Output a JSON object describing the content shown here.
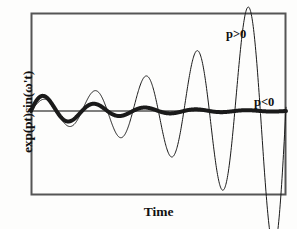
{
  "figure": {
    "background_color": "#fdfdfc",
    "frame_color": "#555555",
    "curve_color": "#1a1a1a"
  },
  "chart_data": {
    "type": "line",
    "title": "",
    "xlabel": "Time",
    "ylabel": "exp(pt)sin(ω't)",
    "grid": false,
    "legend": "inline-annotations",
    "axis_ticks": false,
    "xlim": [
      0,
      8
    ],
    "ylim": [
      -2.6,
      2.6
    ],
    "baseline": 0,
    "annotations": [
      {
        "text": "p>0",
        "x": 6.1,
        "y": 2.3
      },
      {
        "text": "p<0",
        "x": 7.0,
        "y": 0.45
      }
    ],
    "series": [
      {
        "name": "p>0",
        "label": "p>0",
        "description": "Exponentially growing damped sinusoid, thin stroke",
        "line_width": 1,
        "formula": "exp(pt)sin(ω't) with p > 0",
        "growth_rate": 0.34,
        "angular_frequency": 3.93,
        "initial_amplitude": 0.33,
        "x": [
          0,
          0.4,
          0.8,
          1.2,
          1.6,
          2.0,
          2.4,
          2.8,
          3.2,
          3.6,
          4.0,
          4.4,
          4.8,
          5.2,
          5.6,
          6.0,
          6.4,
          6.8,
          7.2,
          7.6,
          8.0
        ],
        "values": [
          0,
          0.37,
          0.09,
          -0.35,
          -0.34,
          0.26,
          0.58,
          0.05,
          -0.69,
          -0.56,
          0.48,
          1.07,
          0.1,
          -1.35,
          -1.08,
          0.92,
          2.03,
          0.18,
          -2.58,
          -2.06,
          1.76
        ]
      },
      {
        "name": "p<0",
        "label": "p<0",
        "description": "Exponentially decaying sinusoid, thick stroke",
        "line_width": 4,
        "formula": "exp(pt)sin(ω't) with p < 0",
        "growth_rate": -0.46,
        "angular_frequency": 3.93,
        "initial_amplitude": 0.58,
        "x": [
          0,
          0.4,
          0.8,
          1.2,
          1.6,
          2.0,
          2.4,
          2.8,
          3.2,
          3.6,
          4.0,
          4.4,
          4.8,
          5.2,
          5.6,
          6.0,
          6.4,
          6.8,
          7.2,
          7.6,
          8.0
        ],
        "values": [
          0,
          0.55,
          0.13,
          -0.41,
          -0.33,
          0.21,
          0.4,
          0.03,
          -0.32,
          -0.22,
          0.14,
          0.26,
          0.02,
          -0.2,
          -0.14,
          0.09,
          0.16,
          0.01,
          -0.13,
          -0.09,
          0.06
        ]
      }
    ]
  }
}
